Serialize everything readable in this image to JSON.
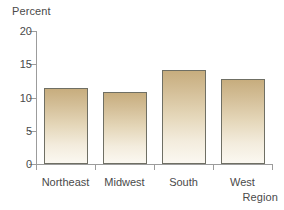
{
  "chart_data": {
    "type": "bar",
    "title": "",
    "subtitle": "",
    "xlabel": "Region",
    "ylabel": "Percent",
    "categories": [
      "Northeast",
      "Midwest",
      "South",
      "West"
    ],
    "values": [
      11.4,
      10.8,
      14.2,
      12.8
    ],
    "series": [
      {
        "name": "Percent",
        "values": [
          11.4,
          10.8,
          14.2,
          12.8
        ]
      }
    ],
    "ylim": [
      0,
      20
    ],
    "yticks": [
      0,
      5,
      10,
      15,
      20
    ],
    "ytick_labels": [
      "0",
      "5",
      "10",
      "15",
      "20"
    ],
    "grid": false,
    "legend": "none",
    "bar_fill_top_color": "#c7ad7e",
    "bar_fill_bottom_color": "#fbf8f1",
    "bar_border_color": "#6f6f64",
    "axis_color": "#9c9c9c",
    "text_color": "#4a4a4a",
    "background_color": "#ffffff"
  }
}
